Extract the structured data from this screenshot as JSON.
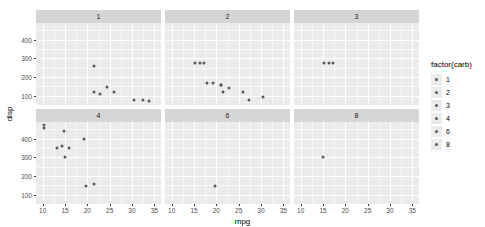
{
  "chart_data": {
    "type": "scatter",
    "title": "",
    "xlabel": "mpg",
    "ylabel": "disp",
    "xlim": [
      8.5,
      36.5
    ],
    "ylim": [
      50,
      490
    ],
    "xticks": [
      10,
      15,
      20,
      25,
      30,
      35
    ],
    "yticks": [
      100,
      200,
      300,
      400
    ],
    "grid": true,
    "legend": {
      "title": "factor(carb)",
      "position": "right",
      "entries": [
        "1",
        "2",
        "3",
        "4",
        "6",
        "8"
      ]
    },
    "facet": {
      "variable": "factor(carb)",
      "rows": 2,
      "cols": 3,
      "labels": [
        "1",
        "2",
        "3",
        "4",
        "6",
        "8"
      ]
    },
    "point_color": "#595959",
    "panel_bg": "#ebebeb",
    "strip_bg": "#d5d5d5",
    "gridline_color": "#ffffff",
    "panels": [
      {
        "label": "1",
        "x": [
          22.8,
          24.4,
          21.5,
          32.4,
          30.4,
          33.9,
          21.4,
          26.0
        ],
        "y": [
          108.0,
          146.7,
          120.1,
          78.7,
          75.7,
          71.1,
          258.0,
          120.3
        ]
      },
      {
        "label": "2",
        "x": [
          21.0,
          21.0,
          22.8,
          19.2,
          17.8,
          16.4,
          17.3,
          15.2,
          30.4,
          21.4,
          26.0,
          27.3
        ],
        "y": [
          160.0,
          160.0,
          140.8,
          167.6,
          167.6,
          275.8,
          275.8,
          275.8,
          95.1,
          121.0,
          120.3,
          79.0
        ]
      },
      {
        "label": "3",
        "x": [
          16.4,
          17.3,
          15.2
        ],
        "y": [
          275.8,
          275.8,
          275.8
        ]
      },
      {
        "label": "4",
        "x": [
          14.3,
          10.4,
          10.4,
          14.7,
          19.7,
          13.3,
          19.2,
          15.8,
          15.0,
          21.4
        ],
        "y": [
          360.0,
          472.0,
          460.0,
          440.0,
          145.0,
          350.0,
          400.0,
          351.0,
          301.0,
          160.0
        ]
      },
      {
        "label": "6",
        "x": [
          19.7
        ],
        "y": [
          145.0
        ]
      },
      {
        "label": "8",
        "x": [
          15.0
        ],
        "y": [
          301.0
        ]
      }
    ]
  }
}
